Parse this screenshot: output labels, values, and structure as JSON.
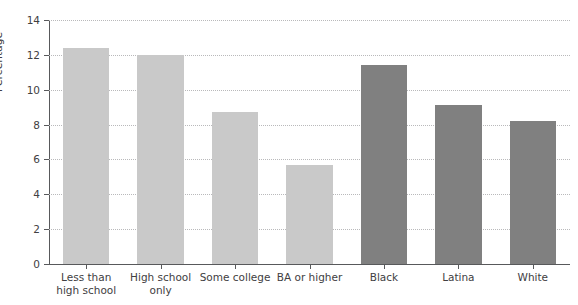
{
  "chart_data": {
    "type": "bar",
    "title": "",
    "subtitle": "",
    "xlabel": "",
    "ylabel": "Percentage",
    "ylim": [
      0,
      14
    ],
    "yticks": [
      0,
      2,
      4,
      6,
      8,
      10,
      12,
      14
    ],
    "ytick_labels": [
      "0",
      "2",
      "4",
      "6",
      "8",
      "10",
      "12",
      "14"
    ],
    "grid": "horizontal-dotted",
    "legend": "none",
    "categories": [
      "Less than\nhigh school",
      "High school\nonly",
      "Some college",
      "BA or higher",
      "Black",
      "Latina",
      "White"
    ],
    "values": [
      12.4,
      12.0,
      8.7,
      5.7,
      11.4,
      9.1,
      8.2
    ],
    "bar_colors": [
      "#c9c9c9",
      "#c9c9c9",
      "#c9c9c9",
      "#c9c9c9",
      "#808080",
      "#808080",
      "#808080"
    ],
    "groups": [
      {
        "name": "Education",
        "categories": [
          "Less than high school",
          "High school only",
          "Some college",
          "BA or higher"
        ],
        "color": "#c9c9c9"
      },
      {
        "name": "Race/Ethnicity",
        "categories": [
          "Black",
          "Latina",
          "White"
        ],
        "color": "#808080"
      }
    ],
    "axis_color": "#58595b",
    "gridline_color": "#b9b9bb",
    "background": "#ffffff"
  }
}
